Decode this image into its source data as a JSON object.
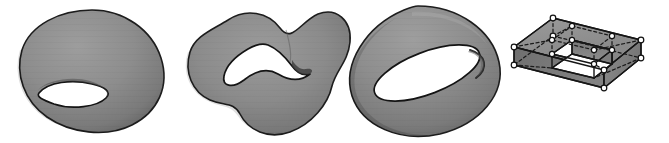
{
  "figure": {
    "title": "Four homeomorphic genus-one surfaces",
    "background_color": "#ffffff",
    "width": 669,
    "height": 143,
    "panel_count": 4,
    "style": {
      "surface_fill_light": "#a3a3a3",
      "surface_fill_mid": "#8a8a8a",
      "surface_fill_dark": "#6c6c6c",
      "surface_fill_deep": "#555555",
      "outline_color": "#1d1d1d",
      "hole_fill": "#ffffff",
      "vertex_fill": "#ffffff",
      "vertex_stroke": "#111111",
      "hidden_edge_style": "dashed"
    }
  },
  "panels": [
    {
      "index": 1,
      "name": "deformed-torus-blob",
      "label": "Deformed torus (smooth blob with one handle)",
      "genus": 1,
      "holes": 1,
      "rendering": "smooth-shaded",
      "bbox": {
        "x": 18,
        "y": 10,
        "width": 146,
        "height": 122
      }
    },
    {
      "index": 2,
      "name": "wavy-deformed-torus",
      "label": "Wavy deformed torus with curved hole",
      "genus": 1,
      "holes": 1,
      "rendering": "smooth-shaded",
      "bbox": {
        "x": 182,
        "y": 8,
        "width": 156,
        "height": 130
      }
    },
    {
      "index": 3,
      "name": "standard-torus",
      "label": "Standard torus",
      "genus": 1,
      "holes": 1,
      "rendering": "smooth-shaded",
      "bbox": {
        "x": 348,
        "y": 6,
        "width": 152,
        "height": 132
      }
    },
    {
      "index": 4,
      "name": "polyhedral-square-frame-torus",
      "label": "Polyhedral square frame (combinatorial torus)",
      "genus": 1,
      "holes": 1,
      "rendering": "wireframe-with-faces",
      "vertex_count": 16,
      "hidden_edges": "dashed",
      "bbox": {
        "x": 512,
        "y": 14,
        "width": 146,
        "height": 116
      }
    }
  ]
}
